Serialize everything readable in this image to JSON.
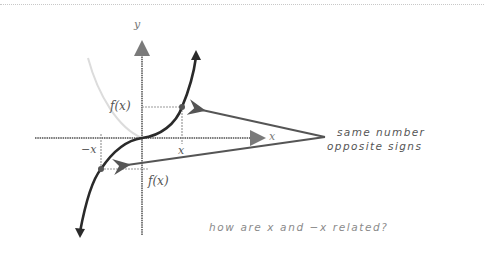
{
  "diagram": {
    "axes": {
      "x_label": "x",
      "y_label": "y"
    },
    "points": {
      "positive": {
        "x_label": "x",
        "y_label": "f(x)"
      },
      "negative": {
        "x_label": "−x",
        "y_label": "f(x)"
      }
    },
    "annotations": {
      "note_line1": "same number",
      "note_line2": "opposite signs",
      "question": "how are x and  −x related?"
    },
    "colors": {
      "curve": "#2a2a2a",
      "axis": "#7a7a7a",
      "guide": "#9a9a9a",
      "ghost_curve": "#dcdcdc",
      "arrow": "#555555"
    }
  }
}
